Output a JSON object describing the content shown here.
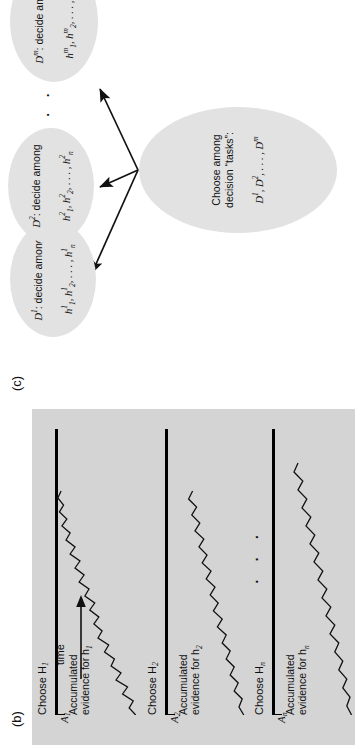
{
  "figure": {
    "panels": [
      {
        "id": "b",
        "label": "(b)",
        "title": "Race model",
        "type": "accumulator-race-diagram",
        "time_axis_label": "time",
        "ellipsis": "· · ·",
        "rows": [
          {
            "choose_label": "Choose H",
            "choose_sub": "1",
            "threshold_label": "A",
            "threshold_sub": "1",
            "evidence_label_line1": "Accumulated",
            "evidence_label_line2": "evidence for h",
            "evidence_sub": "1"
          },
          {
            "choose_label": "Choose H",
            "choose_sub": "2",
            "threshold_label": "A",
            "threshold_sub": "2",
            "evidence_label_line1": "Accumulated",
            "evidence_label_line2": "evidence for h",
            "evidence_sub": "2"
          },
          {
            "choose_label": "Choose H",
            "choose_sub": "n",
            "threshold_label": "A",
            "threshold_sub": "n",
            "evidence_label_line1": "Accumulated",
            "evidence_label_line2": "evidence for h",
            "evidence_sub": "n"
          }
        ]
      },
      {
        "id": "c",
        "label": "(c)",
        "type": "hierarchical-decision-tree",
        "ellipsis": "· · ·",
        "root": {
          "line1": "Choose among",
          "line2": "decision “tasks”:",
          "line3_base": "D",
          "line3_sup1": "1",
          "line3_mid": ", D",
          "line3_sup2": "2",
          "line3_tail": ", . . . , D",
          "line3_sup3": "m"
        },
        "children": [
          {
            "head_base": "D",
            "head_sup": "1",
            "head_tail": ": decide among",
            "body_base": "h",
            "body_sup": "1",
            "body_sub1": "1",
            "body_sub2": "2",
            "body_subn": "n"
          },
          {
            "head_base": "D",
            "head_sup": "2",
            "head_tail": ": decide among",
            "body_base": "h",
            "body_sup": "2",
            "body_sub1": "1",
            "body_sub2": "2",
            "body_subn": "n"
          },
          {
            "head_base": "D",
            "head_sup": "m",
            "head_tail": ": decide among",
            "body_base": "h",
            "body_sup": "m",
            "body_sub1": "1",
            "body_sub2": "2",
            "body_subn": "n"
          }
        ]
      }
    ]
  },
  "colors": {
    "panel_background": "#d4d4d4",
    "ellipse_fill": "#e2e2e2",
    "ink": "#111111",
    "page_background": "#ffffff"
  },
  "chart_data": {
    "type": "line",
    "title": "Race model",
    "xlabel": "time",
    "ylabel": "Accumulated evidence",
    "series": [
      {
        "name": "Accumulator h1",
        "threshold": "A1",
        "decision": "Choose H1",
        "path": "M 0,96 L 7,88 L 14,93 L 21,80 L 28,86 L 35,72 L 42,78 L 49,66 L 56,70 L 63,58 L 70,63 L 77,50 L 84,55 L 91,45 L 98,51 L 105,40 L 112,46 L 119,34 L 126,39 L 133,27 L 140,33 L 147,22 L 154,28 L 161,16 L 168,22 L 175,11 L 182,16 L 189,6 L 196,12 L 203,3 L 210,8 L 217,1 L 224,5"
      },
      {
        "name": "Accumulator h2",
        "threshold": "A2",
        "decision": "Choose H2",
        "path": "M 0,96 L 8,90 L 16,94 L 24,84 L 32,89 L 40,79 L 48,84 L 56,74 L 64,79 L 72,69 L 80,74 L 88,63 L 96,69 L 104,58 L 112,64 L 120,54 L 128,60 L 136,49 L 144,55 L 152,44 L 160,50 L 168,40 L 176,46 L 184,35 L 192,41 L 200,31 L 208,37 L 216,27 L 224,32"
      },
      {
        "name": "Accumulator hn",
        "threshold": "An",
        "decision": "Choose Hn",
        "path": "M 0,97 L 9,91 L 18,95 L 27,86 L 36,91 L 45,81 L 54,86 L 63,76 L 72,81 L 81,70 L 90,76 L 99,65 L 108,71 L 117,60 L 126,66 L 135,55 L 144,61 L 153,50 L 162,56 L 171,45 L 180,51 L 189,40 L 198,46 L 207,35 L 216,41 L 225,30 L 234,36 L 243,25 L 252,30"
      }
    ]
  }
}
